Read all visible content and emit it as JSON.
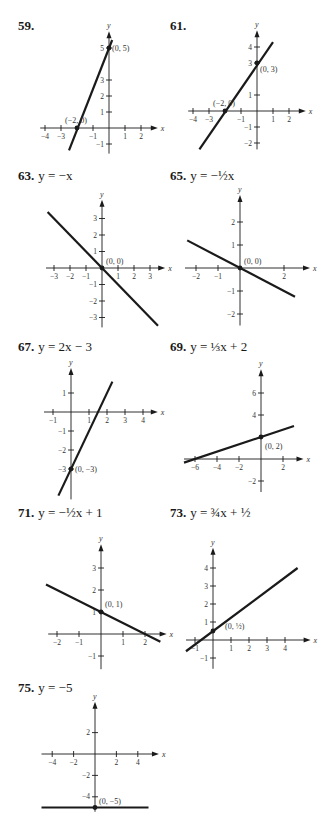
{
  "page": {
    "width": 319,
    "height": 816,
    "ink_color": "#1a1a1a",
    "background": "#ffffff"
  },
  "chart_data": [
    {
      "id": "59",
      "type": "line",
      "title": "59.",
      "equation": "",
      "xlabel": "x",
      "ylabel": "y",
      "xticks": [
        -4,
        -3,
        -1,
        1,
        2
      ],
      "yticks": [
        -1,
        1,
        2,
        3,
        5
      ],
      "xlim": [
        -4.3,
        2.8
      ],
      "ylim": [
        -1.6,
        5.8
      ],
      "line": {
        "x": [
          -2.5,
          0.2
        ],
        "y": [
          -1.4,
          5.5
        ]
      },
      "points": [
        {
          "x": 0,
          "y": 5,
          "label": "(0, 5)"
        },
        {
          "x": -2,
          "y": 0,
          "label": "(−2, 0)"
        }
      ]
    },
    {
      "id": "61",
      "type": "line",
      "title": "61.",
      "equation": "",
      "xlabel": "x",
      "ylabel": "y",
      "xticks": [
        -4,
        -3,
        -1,
        1,
        2
      ],
      "yticks": [
        -2,
        -1,
        1,
        3,
        4
      ],
      "xlim": [
        -4.3,
        2.8
      ],
      "ylim": [
        -2.4,
        4.8
      ],
      "line": {
        "x": [
          -3.6,
          1.0
        ],
        "y": [
          -2.4,
          4.3
        ]
      },
      "points": [
        {
          "x": 0,
          "y": 3,
          "label": "(0, 3)"
        },
        {
          "x": -2,
          "y": 0,
          "label": "(−2, 0)"
        }
      ]
    },
    {
      "id": "63",
      "type": "line",
      "title": "63.",
      "equation": "y = −x",
      "xlabel": "x",
      "ylabel": "y",
      "xticks": [
        -3,
        -2,
        -1,
        1,
        2,
        3
      ],
      "yticks": [
        -3,
        -2,
        -1,
        1,
        2,
        3
      ],
      "xlim": [
        -3.5,
        3.7
      ],
      "ylim": [
        -3.6,
        3.9
      ],
      "line": {
        "x": [
          -3.4,
          3.5
        ],
        "y": [
          3.4,
          -3.5
        ]
      },
      "points": [
        {
          "x": 0,
          "y": 0,
          "label": "(0, 0)"
        }
      ]
    },
    {
      "id": "65",
      "type": "line",
      "title": "65.",
      "equation": "y = −½x",
      "xlabel": "x",
      "ylabel": "y",
      "xticks": [
        -2,
        -1,
        2
      ],
      "yticks": [
        -2,
        -1,
        1,
        2
      ],
      "xlim": [
        -2.5,
        3.0
      ],
      "ylim": [
        -2.5,
        3.0
      ],
      "line": {
        "x": [
          -2.4,
          2.5
        ],
        "y": [
          1.2,
          -1.25
        ]
      },
      "points": [
        {
          "x": 0,
          "y": 0,
          "label": "(0, 0)"
        }
      ]
    },
    {
      "id": "67",
      "type": "line",
      "title": "67.",
      "equation": "y = 2x − 3",
      "xlabel": "x",
      "ylabel": "y",
      "xticks": [
        -1,
        1,
        2,
        3,
        4
      ],
      "yticks": [
        -3,
        -2,
        -1,
        1
      ],
      "xlim": [
        -1.5,
        4.6
      ],
      "ylim": [
        -4.6,
        2.1
      ],
      "line": {
        "x": [
          -0.7,
          2.3
        ],
        "y": [
          -4.4,
          1.6
        ]
      },
      "points": [
        {
          "x": 0,
          "y": -3,
          "label": "(0, −3)"
        }
      ]
    },
    {
      "id": "69",
      "type": "line",
      "title": "69.",
      "equation": "y = ⅓x + 2",
      "xlabel": "x",
      "ylabel": "y",
      "xticks": [
        -6,
        -4,
        -2,
        2
      ],
      "yticks": [
        -2,
        4,
        6
      ],
      "xlim": [
        -7.0,
        3.5
      ],
      "ylim": [
        -3.0,
        7.8
      ],
      "line": {
        "x": [
          -7.0,
          3.0
        ],
        "y": [
          -0.33,
          3.0
        ]
      },
      "points": [
        {
          "x": 0,
          "y": 2,
          "label": "(0, 2)"
        }
      ]
    },
    {
      "id": "71",
      "type": "line",
      "title": "71.",
      "equation": "y = −½x + 1",
      "xlabel": "x",
      "ylabel": "y",
      "xticks": [
        -2,
        -1,
        1,
        2
      ],
      "yticks": [
        -1,
        1,
        2,
        3
      ],
      "xlim": [
        -2.4,
        2.8
      ],
      "ylim": [
        -1.6,
        3.9
      ],
      "line": {
        "x": [
          -2.5,
          2.7
        ],
        "y": [
          2.25,
          -0.35
        ]
      },
      "points": [
        {
          "x": 0,
          "y": 1,
          "label": "(0, 1)"
        }
      ]
    },
    {
      "id": "73",
      "type": "line",
      "title": "73.",
      "equation": "y = ¾x + ½",
      "xlabel": "x",
      "ylabel": "y",
      "xticks": [
        -1,
        1,
        2,
        3,
        4
      ],
      "yticks": [
        -1,
        1,
        2,
        3,
        4
      ],
      "xlim": [
        -1.5,
        5.2
      ],
      "ylim": [
        -1.6,
        4.9
      ],
      "line": {
        "x": [
          -1.5,
          4.7
        ],
        "y": [
          -0.625,
          4.0
        ]
      },
      "points": [
        {
          "x": 0,
          "y": 0.5,
          "label": "(0, ½)"
        }
      ]
    },
    {
      "id": "75",
      "type": "line",
      "title": "75.",
      "equation": "y = −5",
      "xlabel": "x",
      "ylabel": "y",
      "xticks": [
        -4,
        -2,
        2,
        4
      ],
      "yticks": [
        -4,
        -2,
        2
      ],
      "xlim": [
        -5.0,
        5.6
      ],
      "ylim": [
        -5.4,
        4.5
      ],
      "line": {
        "x": [
          -5.0,
          5.0
        ],
        "y": [
          -5,
          -5
        ]
      },
      "points": [
        {
          "x": 0,
          "y": -5,
          "label": "(0, −5)"
        }
      ]
    }
  ],
  "problems": [
    {
      "number": "59.",
      "equation": ""
    },
    {
      "number": "61.",
      "equation": ""
    },
    {
      "number": "63.",
      "equation": "y = −x"
    },
    {
      "number": "65.",
      "equation": "y = −½x"
    },
    {
      "number": "67.",
      "equation": "y = 2x − 3"
    },
    {
      "number": "69.",
      "equation": "y = ⅓x + 2"
    },
    {
      "number": "71.",
      "equation": "y = −½x + 1"
    },
    {
      "number": "73.",
      "equation": "y = ¾x + ½"
    },
    {
      "number": "75.",
      "equation": "y = −5"
    }
  ],
  "layout": [
    {
      "label_x": 18,
      "label_y": 18,
      "ox": 109,
      "oy": 128,
      "ux": 16,
      "uy": 16
    },
    {
      "label_x": 170,
      "label_y": 18,
      "ox": 257,
      "oy": 111,
      "ux": 16,
      "uy": 16
    },
    {
      "label_x": 18,
      "label_y": 168,
      "ox": 102,
      "oy": 268,
      "ux": 16,
      "uy": 16.5
    },
    {
      "label_x": 170,
      "label_y": 168,
      "ox": 240,
      "oy": 268,
      "ux": 22,
      "uy": 23
    },
    {
      "label_x": 18,
      "label_y": 339,
      "ox": 71,
      "oy": 412,
      "ux": 18,
      "uy": 19
    },
    {
      "label_x": 170,
      "label_y": 339,
      "ox": 261,
      "oy": 459,
      "ux": 11,
      "uy": 11
    },
    {
      "label_x": 18,
      "label_y": 505,
      "ox": 101,
      "oy": 634,
      "ux": 22,
      "uy": 22
    },
    {
      "label_x": 170,
      "label_y": 505,
      "ox": 213,
      "oy": 640,
      "ux": 18,
      "uy": 18
    },
    {
      "label_x": 18,
      "label_y": 680,
      "ox": 95,
      "oy": 754,
      "ux": 10.7,
      "uy": 10.7
    }
  ]
}
